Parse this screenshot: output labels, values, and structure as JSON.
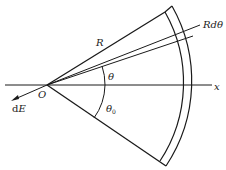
{
  "labels": {
    "radius": "R",
    "arc_element": "Rdθ",
    "angle": "θ",
    "angle0": "θ",
    "angle0_sub": "0",
    "origin": "O",
    "axis": "x",
    "field_d": "d",
    "field_E": "E"
  },
  "colors": {
    "stroke": "#1a1a1a",
    "background": "#ffffff"
  }
}
